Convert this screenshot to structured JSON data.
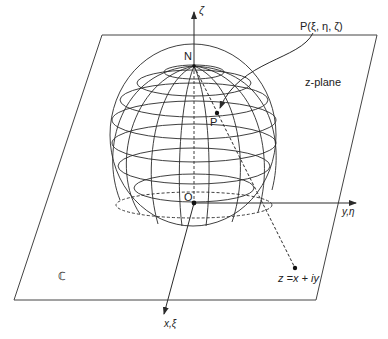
{
  "diagram": {
    "labels": {
      "zeta_axis": "ζ",
      "north_pole": "N",
      "point_P_coords": "P(ξ, η, ζ)",
      "point_P": "P",
      "origin": "O",
      "plane_name": "z-plane",
      "y_axis": "y,η",
      "x_axis": "x,ξ",
      "complex_symbol": "ℂ",
      "z_point": "z =x + iy"
    },
    "colors": {
      "stroke": "#2a2a2a",
      "background": "#ffffff"
    }
  }
}
